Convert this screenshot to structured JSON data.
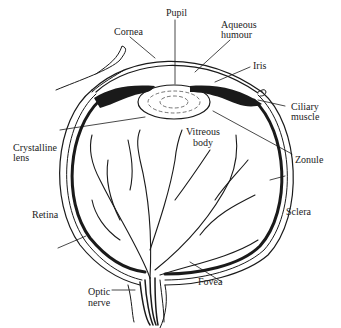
{
  "diagram": {
    "labels": {
      "pupil": "Pupil",
      "cornea": "Cornea",
      "aqueous_humour_1": "Aqueous",
      "aqueous_humour_2": "humour",
      "iris": "Iris",
      "ciliary_muscle_1": "Ciliary",
      "ciliary_muscle_2": "muscle",
      "crystalline_lens_1": "Crystalline",
      "crystalline_lens_2": "lens",
      "vitreous_body_1": "Vitreous",
      "vitreous_body_2": "body",
      "zonule": "Zonule",
      "retina": "Retina",
      "sclera": "Sclera",
      "fovea": "Fovea",
      "optic_nerve_1": "Optic",
      "optic_nerve_2": "nerve"
    }
  }
}
